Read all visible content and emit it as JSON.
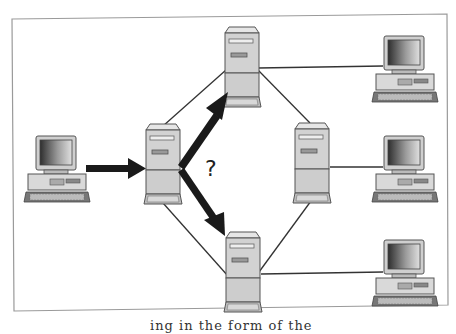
{
  "diagram": {
    "question_mark": "?",
    "caption_fragment": "ing in the form of the",
    "colors": {
      "frame": "#9a9a9a",
      "link": "#333333",
      "arrow": "#1a1a1a",
      "device_body": "#d6d6d6",
      "device_outline": "#555555",
      "screen_dark": "#3a3a3a",
      "screen_light": "#d8d8d8"
    },
    "nodes": [
      {
        "id": "source-pc",
        "type": "workstation",
        "label": ""
      },
      {
        "id": "router-left",
        "type": "server",
        "label": ""
      },
      {
        "id": "router-top",
        "type": "server",
        "label": ""
      },
      {
        "id": "router-right",
        "type": "server",
        "label": ""
      },
      {
        "id": "router-bottom",
        "type": "server",
        "label": ""
      },
      {
        "id": "dest-pc-top",
        "type": "workstation",
        "label": ""
      },
      {
        "id": "dest-pc-middle",
        "type": "workstation",
        "label": ""
      },
      {
        "id": "dest-pc-bottom",
        "type": "workstation",
        "label": ""
      }
    ],
    "links": [
      {
        "from": "router-left",
        "to": "router-top"
      },
      {
        "from": "router-left",
        "to": "router-bottom"
      },
      {
        "from": "router-top",
        "to": "router-right"
      },
      {
        "from": "router-bottom",
        "to": "router-right"
      },
      {
        "from": "router-top",
        "to": "dest-pc-top"
      },
      {
        "from": "router-right",
        "to": "dest-pc-middle"
      },
      {
        "from": "router-bottom",
        "to": "dest-pc-bottom"
      }
    ],
    "arrows": [
      {
        "from": "source-pc",
        "to": "router-left"
      },
      {
        "from": "router-left",
        "to": "router-top"
      },
      {
        "from": "router-left",
        "to": "router-bottom"
      }
    ]
  }
}
